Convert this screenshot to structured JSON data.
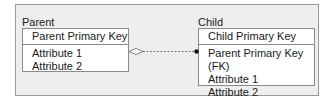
{
  "diagram": {
    "entities": [
      {
        "name": "Parent",
        "primary_key": "Parent Primary Key",
        "attributes": [
          "Attribute 1",
          "Attribute 2"
        ]
      },
      {
        "name": "Child",
        "primary_key": "Child Primary Key",
        "attributes": [
          "Parent Primary Key (FK)",
          "Attribute 1",
          "Attribute 2"
        ]
      }
    ],
    "relationship": {
      "from": "Parent",
      "to": "Child",
      "from_end": "hollow-diamond",
      "to_end": "filled-dot",
      "line_style": "dashed"
    },
    "colors": {
      "panel_background": "#eeeeee",
      "panel_border": "#9a9a9a",
      "entity_background": "#ffffff",
      "entity_border": "#8a8a8a",
      "line": "#555555"
    }
  }
}
